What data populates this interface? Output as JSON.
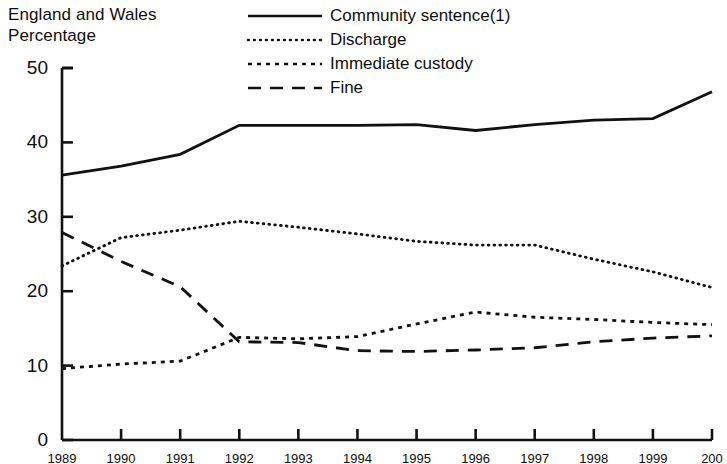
{
  "header": {
    "region": "England and Wales",
    "unit": "Percentage"
  },
  "legend": [
    {
      "label": "Community sentence(1)",
      "style": "solid",
      "swatch_name": "legend-swatch-solid"
    },
    {
      "label": "Discharge",
      "style": "dotted",
      "swatch_name": "legend-swatch-dotted"
    },
    {
      "label": "Immediate custody",
      "style": "dash-dot",
      "swatch_name": "legend-swatch-dash-dot"
    },
    {
      "label": "Fine",
      "style": "dashed",
      "swatch_name": "legend-swatch-dashed"
    }
  ],
  "axes": {
    "y_ticks": [
      "50",
      "40",
      "30",
      "20",
      "10",
      "0"
    ],
    "x_ticks": [
      "1989",
      "1990",
      "1991",
      "1992",
      "1993",
      "1994",
      "1995",
      "1996",
      "1997",
      "1998",
      "1999",
      "200"
    ]
  },
  "chart_data": {
    "type": "line",
    "title": "",
    "subtitle": "",
    "xlabel": "",
    "ylabel": "Percentage",
    "ylim": [
      0,
      50
    ],
    "yticks": [
      0,
      10,
      20,
      30,
      40,
      50
    ],
    "grid": false,
    "legend_position": "top-right",
    "categories": [
      "1989",
      "1990",
      "1991",
      "1992",
      "1993",
      "1994",
      "1995",
      "1996",
      "1997",
      "1998",
      "1999",
      "2000"
    ],
    "series": [
      {
        "name": "Community sentence(1)",
        "style": "solid",
        "values": [
          35.6,
          36.8,
          38.4,
          42.3,
          42.3,
          42.3,
          42.4,
          41.6,
          42.4,
          43.0,
          43.2,
          46.8
        ]
      },
      {
        "name": "Discharge",
        "style": "dotted",
        "values": [
          23.4,
          27.2,
          28.2,
          29.4,
          28.6,
          27.7,
          26.7,
          26.2,
          26.2,
          24.3,
          22.6,
          20.5
        ]
      },
      {
        "name": "Immediate custody",
        "style": "dash-dot",
        "values": [
          9.6,
          10.2,
          10.6,
          13.8,
          13.6,
          13.9,
          15.6,
          17.2,
          16.5,
          16.2,
          15.8,
          15.5
        ]
      },
      {
        "name": "Fine",
        "style": "dashed",
        "values": [
          27.9,
          24.0,
          20.6,
          13.2,
          13.1,
          12.0,
          11.9,
          12.1,
          12.4,
          13.2,
          13.7,
          14.0
        ]
      }
    ]
  },
  "colors": {
    "ink": "#111111",
    "background": "#ffffff"
  }
}
